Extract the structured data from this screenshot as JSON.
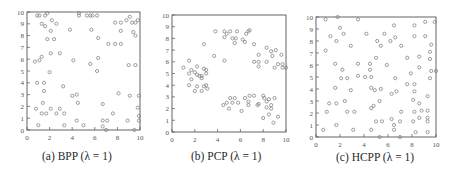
{
  "chart_data": [
    {
      "type": "scatter",
      "title": "(a) BPP (λ = 1)",
      "caption": "(a) BPP (λ = 1)",
      "xlabel": "",
      "ylabel": "",
      "xlim": [
        0,
        10
      ],
      "ylim": [
        0,
        10
      ],
      "xticks": [
        0,
        2,
        4,
        6,
        8,
        10
      ],
      "yticks": [
        0,
        1,
        2,
        3,
        4,
        5,
        6,
        7,
        8,
        9,
        10
      ],
      "grid": false,
      "marker": "open-circle",
      "color": "#777777",
      "frame": {
        "x": 27,
        "y": 12,
        "w": 113,
        "h": 118
      },
      "points": [
        [
          0.9,
          9.7
        ],
        [
          1.1,
          9.7
        ],
        [
          1.6,
          9.7
        ],
        [
          1.8,
          9.9
        ],
        [
          1.3,
          9.0
        ],
        [
          1.6,
          8.8
        ],
        [
          2.2,
          9.3
        ],
        [
          2.6,
          9.0
        ],
        [
          2.1,
          8.4
        ],
        [
          1.8,
          7.7
        ],
        [
          2.4,
          7.7
        ],
        [
          3.8,
          8.5
        ],
        [
          4.6,
          9.9
        ],
        [
          4.6,
          9.7
        ],
        [
          5.3,
          9.7
        ],
        [
          5.6,
          9.7
        ],
        [
          5.8,
          9.7
        ],
        [
          6.2,
          9.7
        ],
        [
          5.7,
          8.5
        ],
        [
          6.3,
          7.8
        ],
        [
          7.2,
          7.3
        ],
        [
          7.8,
          7.3
        ],
        [
          8.3,
          7.3
        ],
        [
          7.8,
          9.1
        ],
        [
          8.3,
          9.1
        ],
        [
          8.3,
          8.4
        ],
        [
          8.8,
          9.3
        ],
        [
          9.1,
          9.6
        ],
        [
          9.3,
          9.1
        ],
        [
          9.6,
          9.1
        ],
        [
          9.8,
          9.3
        ],
        [
          9.4,
          8.3
        ],
        [
          9.6,
          8.0
        ],
        [
          0.7,
          5.8
        ],
        [
          1.1,
          5.9
        ],
        [
          1.3,
          6.2
        ],
        [
          2.1,
          6.5
        ],
        [
          2.9,
          6.5
        ],
        [
          4.1,
          5.9
        ],
        [
          5.6,
          5.6
        ],
        [
          6.3,
          6.1
        ],
        [
          6.2,
          5.0
        ],
        [
          9.0,
          5.5
        ],
        [
          9.6,
          5.5
        ],
        [
          2.0,
          4.9
        ],
        [
          0.9,
          4.0
        ],
        [
          1.5,
          4.0
        ],
        [
          1.5,
          3.3
        ],
        [
          3.2,
          3.7
        ],
        [
          4.0,
          2.9
        ],
        [
          4.4,
          3.0
        ],
        [
          4.5,
          2.3
        ],
        [
          8.1,
          3.1
        ],
        [
          9.1,
          2.9
        ],
        [
          9.9,
          2.9
        ],
        [
          0.8,
          1.8
        ],
        [
          1.4,
          2.3
        ],
        [
          1.3,
          1.4
        ],
        [
          1.7,
          1.4
        ],
        [
          2.1,
          1.8
        ],
        [
          2.6,
          1.4
        ],
        [
          2.9,
          1.8
        ],
        [
          3.3,
          1.4
        ],
        [
          6.7,
          2.2
        ],
        [
          7.6,
          1.4
        ],
        [
          9.8,
          1.9
        ],
        [
          9.9,
          1.2
        ],
        [
          9.9,
          0.8
        ],
        [
          1.0,
          0.4
        ],
        [
          3.3,
          0.4
        ],
        [
          4.4,
          0.8
        ],
        [
          5.0,
          0.4
        ],
        [
          6.7,
          0.8
        ],
        [
          6.7,
          0.3
        ],
        [
          7.1,
          0.8
        ],
        [
          8.9,
          0.8
        ],
        [
          9.5,
          0.0
        ],
        [
          7.0,
          0.0
        ]
      ]
    },
    {
      "type": "scatter",
      "title": "(b) PCP (λ = 1)",
      "caption": "(b) PCP (λ = 1)",
      "xlabel": "",
      "ylabel": "",
      "xlim": [
        0,
        10
      ],
      "ylim": [
        0,
        10
      ],
      "xticks": [
        0,
        2,
        4,
        6,
        8,
        10
      ],
      "yticks": [
        0,
        1,
        2,
        3,
        4,
        5,
        6,
        7,
        8,
        9,
        10
      ],
      "grid": false,
      "marker": "open-circle",
      "color": "#777777",
      "frame": {
        "x": 172,
        "y": 15,
        "w": 114,
        "h": 117
      },
      "points": [
        [
          1.0,
          5.5
        ],
        [
          1.5,
          6.1
        ],
        [
          1.5,
          5.0
        ],
        [
          1.7,
          5.3
        ],
        [
          1.7,
          4.5
        ],
        [
          2.0,
          5.1
        ],
        [
          2.2,
          4.9
        ],
        [
          2.4,
          4.8
        ],
        [
          2.2,
          5.6
        ],
        [
          2.6,
          4.8
        ],
        [
          2.6,
          4.6
        ],
        [
          2.8,
          5.4
        ],
        [
          3.0,
          5.3
        ],
        [
          3.0,
          5.0
        ],
        [
          1.5,
          4.0
        ],
        [
          2.0,
          3.5
        ],
        [
          2.2,
          3.9
        ],
        [
          2.6,
          3.5
        ],
        [
          2.8,
          3.9
        ],
        [
          3.0,
          4.0
        ],
        [
          3.1,
          3.7
        ],
        [
          2.8,
          7.5
        ],
        [
          3.8,
          8.6
        ],
        [
          3.7,
          6.5
        ],
        [
          4.6,
          6.1
        ],
        [
          4.6,
          8.6
        ],
        [
          4.6,
          8.1
        ],
        [
          4.8,
          8.4
        ],
        [
          5.1,
          8.6
        ],
        [
          5.3,
          8.0
        ],
        [
          5.5,
          7.6
        ],
        [
          5.6,
          8.0
        ],
        [
          5.7,
          8.6
        ],
        [
          6.2,
          7.9
        ],
        [
          6.4,
          7.7
        ],
        [
          6.5,
          8.4
        ],
        [
          6.7,
          8.6
        ],
        [
          6.8,
          8.7
        ],
        [
          7.2,
          7.5
        ],
        [
          7.6,
          6.6
        ],
        [
          7.2,
          6.0
        ],
        [
          7.6,
          5.6
        ],
        [
          7.6,
          6.0
        ],
        [
          8.3,
          7.2
        ],
        [
          8.3,
          6.0
        ],
        [
          8.7,
          6.9
        ],
        [
          8.8,
          6.5
        ],
        [
          9.1,
          7.0
        ],
        [
          9.0,
          5.5
        ],
        [
          9.3,
          5.8
        ],
        [
          9.6,
          6.6
        ],
        [
          9.7,
          5.8
        ],
        [
          9.7,
          5.5
        ],
        [
          10.0,
          5.5
        ],
        [
          4.5,
          2.3
        ],
        [
          4.8,
          2.5
        ],
        [
          5.0,
          2.0
        ],
        [
          5.1,
          2.9
        ],
        [
          5.3,
          2.5
        ],
        [
          5.5,
          2.9
        ],
        [
          6.1,
          1.8
        ],
        [
          5.8,
          2.5
        ],
        [
          6.4,
          2.9
        ],
        [
          6.7,
          2.6
        ],
        [
          6.8,
          3.1
        ],
        [
          6.7,
          2.3
        ],
        [
          7.2,
          3.1
        ],
        [
          7.5,
          2.3
        ],
        [
          7.6,
          2.4
        ],
        [
          8.0,
          3.1
        ],
        [
          8.1,
          2.9
        ],
        [
          8.3,
          2.6
        ],
        [
          8.5,
          2.8
        ],
        [
          8.3,
          2.1
        ],
        [
          8.7,
          2.0
        ],
        [
          8.7,
          2.3
        ],
        [
          9.0,
          2.9
        ],
        [
          8.0,
          1.2
        ],
        [
          8.5,
          1.5
        ],
        [
          8.9,
          0.8
        ],
        [
          9.3,
          1.3
        ]
      ]
    },
    {
      "type": "scatter",
      "title": "(c) HCPP (λ = 1)",
      "caption": "(c) HCPP (λ = 1)",
      "xlabel": "",
      "ylabel": "",
      "xlim": [
        0,
        10
      ],
      "ylim": [
        0,
        10
      ],
      "xticks": [
        0,
        2,
        4,
        6,
        8,
        10
      ],
      "yticks": [
        0,
        1,
        2,
        3,
        4,
        5,
        6,
        7,
        8,
        9,
        10
      ],
      "grid": false,
      "marker": "open-circle",
      "color": "#777777",
      "frame": {
        "x": 316,
        "y": 17,
        "w": 120,
        "h": 120
      },
      "points": [
        [
          0.8,
          9.8
        ],
        [
          1.8,
          10.0
        ],
        [
          3.5,
          9.8
        ],
        [
          2.0,
          9.1
        ],
        [
          1.2,
          8.4
        ],
        [
          2.3,
          8.6
        ],
        [
          1.7,
          8.0
        ],
        [
          0.8,
          7.2
        ],
        [
          2.9,
          7.6
        ],
        [
          4.2,
          8.6
        ],
        [
          5.1,
          8.0
        ],
        [
          5.4,
          7.6
        ],
        [
          5.7,
          8.6
        ],
        [
          6.2,
          8.0
        ],
        [
          6.6,
          8.3
        ],
        [
          7.1,
          7.6
        ],
        [
          6.5,
          9.3
        ],
        [
          8.2,
          9.3
        ],
        [
          9.1,
          9.6
        ],
        [
          9.9,
          9.6
        ],
        [
          8.2,
          8.4
        ],
        [
          9.1,
          8.4
        ],
        [
          9.6,
          7.7
        ],
        [
          9.5,
          7.1
        ],
        [
          9.5,
          6.5
        ],
        [
          1.6,
          6.1
        ],
        [
          3.5,
          6.1
        ],
        [
          4.5,
          6.1
        ],
        [
          4.5,
          5.6
        ],
        [
          5.0,
          6.6
        ],
        [
          5.9,
          6.0
        ],
        [
          7.6,
          6.6
        ],
        [
          8.6,
          6.7
        ],
        [
          8.6,
          5.8
        ],
        [
          2.2,
          5.6
        ],
        [
          2.1,
          4.9
        ],
        [
          2.6,
          4.9
        ],
        [
          3.5,
          5.1
        ],
        [
          4.1,
          5.0
        ],
        [
          4.6,
          5.0
        ],
        [
          6.6,
          4.9
        ],
        [
          7.9,
          5.3
        ],
        [
          9.6,
          5.5
        ],
        [
          10.0,
          5.5
        ],
        [
          9.5,
          4.9
        ],
        [
          1.6,
          4.1
        ],
        [
          2.9,
          3.9
        ],
        [
          4.6,
          4.1
        ],
        [
          4.9,
          3.9
        ],
        [
          5.4,
          4.0
        ],
        [
          6.3,
          3.6
        ],
        [
          6.7,
          3.8
        ],
        [
          7.6,
          4.4
        ],
        [
          8.2,
          4.4
        ],
        [
          8.2,
          3.8
        ],
        [
          9.3,
          3.4
        ],
        [
          8.1,
          3.1
        ],
        [
          1.1,
          2.8
        ],
        [
          1.7,
          2.8
        ],
        [
          2.4,
          3.0
        ],
        [
          5.3,
          3.0
        ],
        [
          8.6,
          2.8
        ],
        [
          4.6,
          2.4
        ],
        [
          4.8,
          2.6
        ],
        [
          8.8,
          2.2
        ],
        [
          9.3,
          2.2
        ],
        [
          0.9,
          2.1
        ],
        [
          2.6,
          2.1
        ],
        [
          3.2,
          2.1
        ],
        [
          7.1,
          2.1
        ],
        [
          8.2,
          2.1
        ],
        [
          8.6,
          1.6
        ],
        [
          9.3,
          1.6
        ],
        [
          1.7,
          1.0
        ],
        [
          5.0,
          1.3
        ],
        [
          5.5,
          1.3
        ],
        [
          6.3,
          1.5
        ],
        [
          6.5,
          1.0
        ],
        [
          7.0,
          1.3
        ],
        [
          8.1,
          1.3
        ],
        [
          9.3,
          1.3
        ],
        [
          0.6,
          0.6
        ],
        [
          3.1,
          0.6
        ],
        [
          4.6,
          0.6
        ],
        [
          6.5,
          0.6
        ],
        [
          8.3,
          0.4
        ],
        [
          9.3,
          0.4
        ],
        [
          5.3,
          0.0
        ],
        [
          7.0,
          0.0
        ]
      ]
    }
  ]
}
